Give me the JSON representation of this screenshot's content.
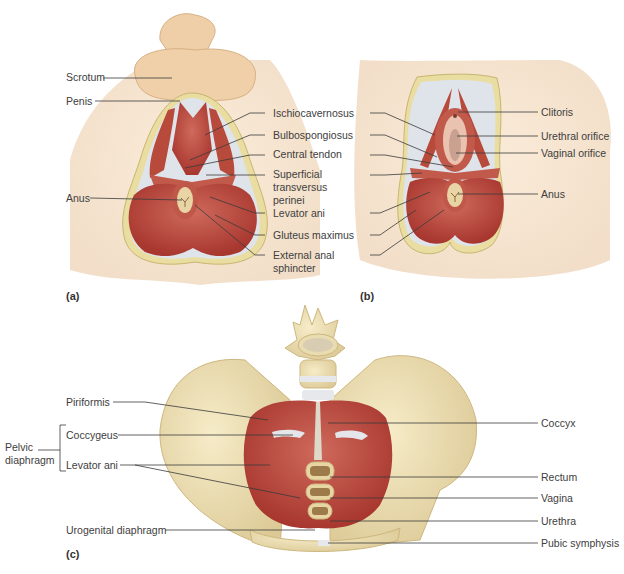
{
  "figure": {
    "colors": {
      "skin": "#f0d2ac",
      "skin_shadow": "#e2bb90",
      "muscle": "#b8443a",
      "muscle_light": "#cf6a5c",
      "fascia": "#dfe3ea",
      "fat_border": "#e8dca0",
      "bone": "#efe2b6",
      "bone_shadow": "#d9c690",
      "leader_line": "#333333"
    },
    "panels": [
      {
        "id": "a",
        "letter": "(a)",
        "subject": "Male perineum",
        "labels_left": [
          "Scrotum",
          "Penis",
          "Anus"
        ],
        "labels_right": [
          "Ischiocavernosus",
          "Bulbospongiosus",
          "Central tendon",
          "Superficial transversus perinei",
          "Levator ani",
          "Gluteus maximus",
          "External anal sphincter"
        ]
      },
      {
        "id": "b",
        "letter": "(b)",
        "subject": "Female perineum",
        "labels_left_shared": [
          "Ischiocavernosus",
          "Bulbospongiosus",
          "Central tendon",
          "Superficial transversus perinei",
          "Levator ani",
          "Gluteus maximus",
          "External anal sphincter"
        ],
        "labels_right": [
          "Clitoris",
          "Urethral orifice",
          "Vaginal orifice",
          "Anus"
        ]
      },
      {
        "id": "c",
        "letter": "(c)",
        "subject": "Pelvic floor, superior view",
        "labels_left": [
          "Piriformis",
          "Coccygeus",
          "Levator ani",
          "Urogenital diaphragm"
        ],
        "bracket_label": "Pelvic diaphragm",
        "labels_right": [
          "Coccyx",
          "Rectum",
          "Vagina",
          "Urethra",
          "Pubic symphysis"
        ]
      }
    ]
  },
  "labels": {
    "scrotum": "Scrotum",
    "penis": "Penis",
    "anus_a": "Anus",
    "ischiocavernosus": "Ischiocavernosus",
    "bulbospongiosus": "Bulbospongiosus",
    "central_tendon": "Central tendon",
    "superficial_transversus_perinei_1": "Superficial",
    "superficial_transversus_perinei_2": "transversus",
    "superficial_transversus_perinei_3": "perinei",
    "levator_ani_ab": "Levator ani",
    "gluteus_maximus": "Gluteus maximus",
    "external_anal_sphincter_1": "External anal",
    "external_anal_sphincter_2": "sphincter",
    "clitoris": "Clitoris",
    "urethral_orifice": "Urethral orifice",
    "vaginal_orifice": "Vaginal orifice",
    "anus_b": "Anus",
    "piriformis": "Piriformis",
    "coccygeus": "Coccygeus",
    "levator_ani_c": "Levator ani",
    "pelvic_diaphragm_1": "Pelvic",
    "pelvic_diaphragm_2": "diaphragm",
    "urogenital_diaphragm": "Urogenital diaphragm",
    "coccyx": "Coccyx",
    "rectum": "Rectum",
    "vagina": "Vagina",
    "urethra": "Urethra",
    "pubic_symphysis": "Pubic symphysis",
    "panel_a": "(a)",
    "panel_b": "(b)",
    "panel_c": "(c)"
  }
}
